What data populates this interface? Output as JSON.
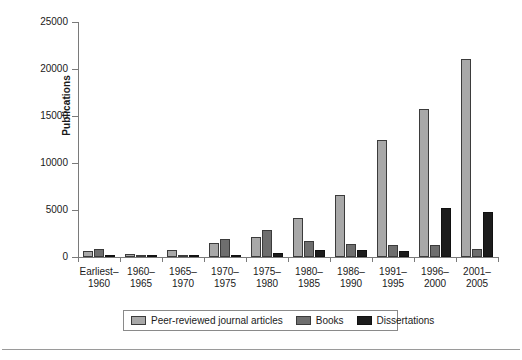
{
  "chart": {
    "ylabel": "Publications",
    "xlabel": "",
    "title": ""
  },
  "chart_data": {
    "type": "bar",
    "title": "",
    "xlabel": "",
    "ylabel": "Publications",
    "ylim": [
      0,
      25000
    ],
    "ytick_labels": [
      "0",
      "5000",
      "10000",
      "15000",
      "20000",
      "25000"
    ],
    "ytick_values": [
      0,
      5000,
      10000,
      15000,
      20000,
      25000
    ],
    "grid": false,
    "legend_position": "bottom",
    "categories": [
      "Earliest–1960",
      "1960–1965",
      "1965–1970",
      "1970–1975",
      "1975–1980",
      "1980–1985",
      "1986–1990",
      "1991–1995",
      "1996–2000",
      "2001–2005"
    ],
    "category_lines": [
      [
        "Earliest–",
        "1960"
      ],
      [
        "1960–",
        "1965"
      ],
      [
        "1965–",
        "1970"
      ],
      [
        "1970–",
        "1975"
      ],
      [
        "1975–",
        "1980"
      ],
      [
        "1980–",
        "1985"
      ],
      [
        "1986–",
        "1990"
      ],
      [
        "1991–",
        "1995"
      ],
      [
        "1996–",
        "2000"
      ],
      [
        "2001–",
        "2005"
      ]
    ],
    "series": [
      {
        "name": "Peer-reviewed journal articles",
        "color": "#a8a8a8",
        "values": [
          600,
          350,
          700,
          1500,
          2100,
          4200,
          6600,
          12400,
          15700,
          21100
        ]
      },
      {
        "name": "Books",
        "color": "#6e6e6e",
        "values": [
          900,
          150,
          200,
          1900,
          2900,
          1700,
          1400,
          1300,
          1300,
          800
        ]
      },
      {
        "name": "Dissertations",
        "color": "#1c1c1c",
        "values": [
          60,
          30,
          60,
          200,
          400,
          750,
          700,
          650,
          5200,
          4800
        ]
      }
    ]
  },
  "legend": {
    "items": [
      {
        "label": "Peer-reviewed journal articles"
      },
      {
        "label": "Books"
      },
      {
        "label": "Dissertations"
      }
    ]
  }
}
